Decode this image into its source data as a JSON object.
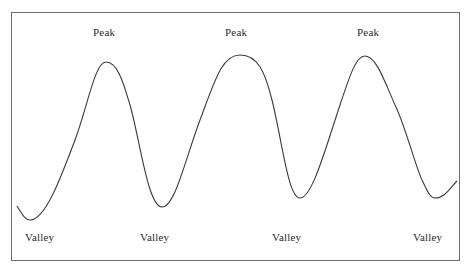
{
  "diagram": {
    "type": "wave",
    "peak_labels": [
      {
        "text": "Peak",
        "x": 93,
        "y": 26
      },
      {
        "text": "Peak",
        "x": 225,
        "y": 26
      },
      {
        "text": "Peak",
        "x": 357,
        "y": 26
      }
    ],
    "valley_labels": [
      {
        "text": "Valley",
        "x": 25,
        "y": 231
      },
      {
        "text": "Valley",
        "x": 140,
        "y": 231
      },
      {
        "text": "Valley",
        "x": 272,
        "y": 231
      },
      {
        "text": "Valley",
        "x": 413,
        "y": 231
      }
    ],
    "curve_points": [
      [
        17,
        206
      ],
      [
        30,
        220
      ],
      [
        106,
        62
      ],
      [
        162,
        207
      ],
      [
        240,
        55
      ],
      [
        300,
        198
      ],
      [
        365,
        56
      ],
      [
        435,
        198
      ],
      [
        457,
        181
      ]
    ],
    "colors": {
      "line": "#3a3a3a",
      "border": "#6e6e6e",
      "text": "#2a2a2a",
      "background": "#ffffff"
    }
  }
}
